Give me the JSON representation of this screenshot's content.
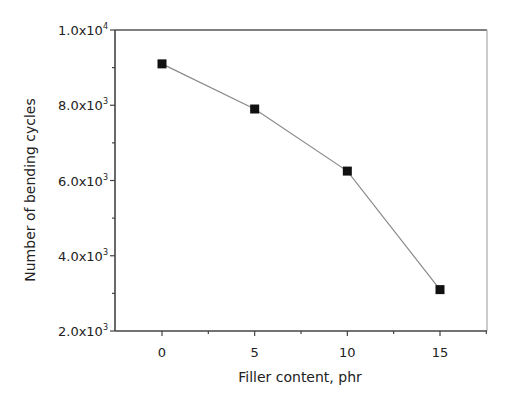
{
  "chart_data": {
    "type": "line",
    "title": "",
    "xlabel": "Filler content, phr",
    "ylabel": "Number of bending cycles",
    "x": [
      0,
      5,
      10,
      15
    ],
    "series": [
      {
        "name": "Bending cycles",
        "values": [
          9100,
          7900,
          6250,
          3100
        ],
        "marker": "square",
        "line_color": "#8a8a8a",
        "marker_color": "#111111"
      }
    ],
    "xlim": [
      -5,
      17.5
    ],
    "ylim": [
      2000,
      10000
    ],
    "x_ticks": [
      0,
      5,
      10,
      15
    ],
    "x_tick_labels": [
      "0",
      "5",
      "10",
      "15"
    ],
    "y_ticks": [
      2000,
      4000,
      6000,
      8000,
      10000
    ],
    "y_tick_labels": [
      {
        "mantissa": "2.0x10",
        "exp": "3"
      },
      {
        "mantissa": "4.0x10",
        "exp": "3"
      },
      {
        "mantissa": "6.0x10",
        "exp": "3"
      },
      {
        "mantissa": "8.0x10",
        "exp": "3"
      },
      {
        "mantissa": "1.0x10",
        "exp": "4"
      }
    ],
    "grid": false,
    "legend": null
  }
}
